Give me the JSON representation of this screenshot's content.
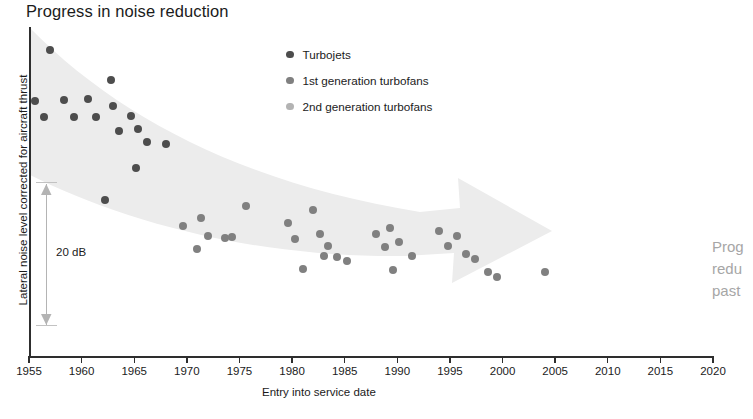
{
  "chart_data": {
    "type": "scatter",
    "title": "Progress in noise reduction",
    "xlabel": "Entry into service date",
    "ylabel": "Lateral noise level corrected for aircraft thrust",
    "xlim": [
      1955,
      2020
    ],
    "ylim": [
      0,
      100
    ],
    "xticks": [
      1955,
      1960,
      1965,
      1970,
      1975,
      1980,
      1985,
      1990,
      1995,
      2000,
      2005,
      2010,
      2015,
      2020
    ],
    "xtick_labels": [
      "1955",
      "1960",
      "1965",
      "1970",
      "1975",
      "1980",
      "1985",
      "1990",
      "1995",
      "2000",
      "2005",
      "2010",
      "2015",
      "2020"
    ],
    "yticks": [],
    "ytick_labels": [],
    "grid": false,
    "legend_position": "top-center",
    "annotations": [
      {
        "name": "scale-bar",
        "text": "20 dB",
        "kind": "double-arrow",
        "x": 1956.2,
        "y_top": 56,
        "y_bottom": 12
      },
      {
        "name": "trend-arrow",
        "text": "",
        "kind": "tapering-band-arrow",
        "description": "broad light-gray arrow sweeping down from upper-left to right, tip near 2012"
      }
    ],
    "series": [
      {
        "name": "Turbojets",
        "color": "#4d4d4d",
        "marker": "circle",
        "marker_size": 8,
        "points": [
          [
            1957.0,
            93.0
          ],
          [
            1955.6,
            77.5
          ],
          [
            1956.4,
            72.6
          ],
          [
            1958.3,
            77.8
          ],
          [
            1959.3,
            72.5
          ],
          [
            1960.6,
            78.0
          ],
          [
            1961.4,
            72.6
          ],
          [
            1962.8,
            84.0
          ],
          [
            1963.0,
            76.0
          ],
          [
            1963.6,
            68.5
          ],
          [
            1964.7,
            73.0
          ],
          [
            1965.4,
            69.0
          ],
          [
            1966.2,
            65.0
          ],
          [
            1965.2,
            57.0
          ],
          [
            1968.0,
            64.5
          ],
          [
            1962.2,
            47.5
          ]
        ]
      },
      {
        "name": "1st generation turbofans",
        "color": "#808080",
        "marker": "circle",
        "marker_size": 8,
        "points": [
          [
            1969.6,
            39.5
          ],
          [
            1971.3,
            42.0
          ],
          [
            1972.0,
            36.5
          ],
          [
            1971.0,
            32.5
          ],
          [
            1973.6,
            36.0
          ],
          [
            1974.3,
            36.2
          ],
          [
            1975.6,
            45.5
          ],
          [
            1979.6,
            40.5
          ],
          [
            1980.3,
            35.5
          ],
          [
            1982.0,
            44.5
          ],
          [
            1982.7,
            37.0
          ],
          [
            1983.4,
            33.5
          ],
          [
            1983.0,
            30.5
          ],
          [
            1984.3,
            30.0
          ],
          [
            1985.2,
            29.0
          ],
          [
            1981.0,
            26.5
          ],
          [
            1988.0,
            37.0
          ],
          [
            1989.3,
            39.0
          ],
          [
            1988.8,
            33.0
          ],
          [
            1990.2,
            34.5
          ],
          [
            1991.4,
            30.5
          ],
          [
            1989.6,
            26.0
          ],
          [
            1994.0,
            38.0
          ],
          [
            1994.8,
            33.5
          ],
          [
            1995.7,
            36.5
          ],
          [
            1996.5,
            31.0
          ],
          [
            1997.4,
            29.5
          ],
          [
            1998.6,
            25.5
          ],
          [
            1999.5,
            24.0
          ],
          [
            2004.0,
            25.5
          ]
        ]
      },
      {
        "name": "2nd generation turbofans",
        "color": "#b3b3b3",
        "marker": "circle",
        "marker_size": 8,
        "points": []
      }
    ]
  },
  "legend": {
    "items": [
      {
        "label": "Turbojets",
        "color": "#4d4d4d"
      },
      {
        "label": "1st generation turbofans",
        "color": "#808080"
      },
      {
        "label": "2nd generation turbofans",
        "color": "#b3b3b3"
      }
    ]
  },
  "side_note": {
    "lines": [
      "Prog",
      "redu",
      "past"
    ]
  },
  "scale_annotation": {
    "label": "20 dB"
  },
  "colors": {
    "axis": "#2e2e2e",
    "text": "#1b1b1b",
    "band": "#ececec",
    "side_note": "#a6a6a6"
  }
}
